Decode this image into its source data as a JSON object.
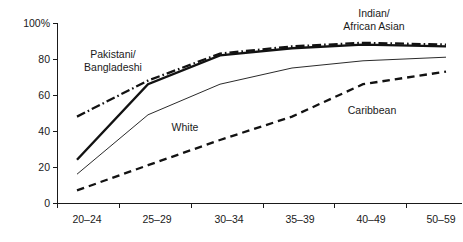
{
  "chart_data": {
    "type": "line",
    "title": "",
    "subtitle": "",
    "xlabel": "",
    "ylabel": "",
    "categories": [
      "20–24",
      "25–29",
      "30–34",
      "35–39",
      "40–49",
      "50–59"
    ],
    "ylim": [
      0,
      100
    ],
    "xlim_note": "categorical age bands",
    "grid": false,
    "legend_position": "inline-annotations",
    "y_ticks": [
      "0",
      "20",
      "40",
      "60",
      "80",
      "100%"
    ],
    "y_tick_values": [
      0,
      20,
      40,
      60,
      80,
      100
    ],
    "series": [
      {
        "name": "Indian/ African Asian",
        "annotation": [
          "Indian/",
          "African Asian"
        ],
        "line_style": "dash-dot",
        "line_width": "thick",
        "color": "#121212",
        "values": [
          48,
          68,
          83,
          87,
          89,
          88
        ]
      },
      {
        "name": "Pakistani/ Bangladeshi",
        "annotation": [
          "Pakistani/",
          "Bangladeshi"
        ],
        "line_style": "solid",
        "line_width": "thick",
        "color": "#121212",
        "values": [
          24,
          66,
          82,
          86,
          88,
          87
        ]
      },
      {
        "name": "White",
        "annotation": [
          "White"
        ],
        "line_style": "solid",
        "line_width": "thin",
        "color": "#121212",
        "values": [
          16,
          49,
          66,
          75,
          79,
          81
        ]
      },
      {
        "name": "Caribbean",
        "annotation": [
          "Caribbean"
        ],
        "line_style": "dashed",
        "line_width": "thick",
        "color": "#121212",
        "values": [
          7,
          21,
          35,
          48,
          66,
          73
        ]
      }
    ],
    "annotations": [
      {
        "text": "Pakistani/",
        "x": 113,
        "y": 58
      },
      {
        "text": "Bangladeshi",
        "x": 113,
        "y": 71
      },
      {
        "text": "Indian/",
        "x": 374,
        "y": 17
      },
      {
        "text": "African Asian",
        "x": 374,
        "y": 30
      },
      {
        "text": "White",
        "x": 185,
        "y": 131
      },
      {
        "text": "Caribbean",
        "x": 372,
        "y": 114
      }
    ]
  }
}
